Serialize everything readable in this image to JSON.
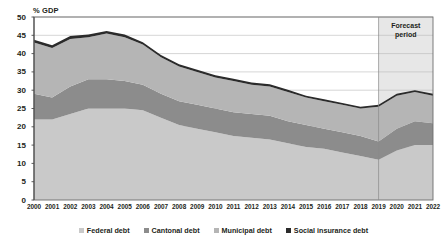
{
  "chart_data": {
    "type": "area",
    "stacked": true,
    "title": "",
    "xlabel": "",
    "ylabel": "% GDP",
    "ylim": [
      0,
      50
    ],
    "ytick_step": 5,
    "yticks": [
      0,
      5,
      10,
      15,
      20,
      25,
      30,
      35,
      40,
      45,
      50
    ],
    "grid": true,
    "grid_axis": "y",
    "legend_position": "bottom",
    "categories": [
      "2000",
      "2001",
      "2002",
      "2003",
      "2004",
      "2005",
      "2006",
      "2007",
      "2008",
      "2009",
      "2010",
      "2011",
      "2012",
      "2013",
      "2014",
      "2015",
      "2016",
      "2017",
      "2018",
      "2019",
      "2020",
      "2021",
      "2022"
    ],
    "series": [
      {
        "name": "Federal debt",
        "color": "#c9c9c9",
        "values": [
          22.0,
          22.0,
          23.5,
          25.0,
          25.0,
          25.0,
          24.5,
          22.5,
          20.5,
          19.5,
          18.5,
          17.5,
          17.0,
          16.5,
          15.5,
          14.5,
          14.0,
          13.0,
          12.0,
          11.0,
          13.5,
          15.0,
          15.0
        ]
      },
      {
        "name": "Cantonal debt",
        "color": "#8c8c8c",
        "values": [
          7.0,
          6.0,
          7.5,
          8.0,
          8.0,
          7.5,
          7.0,
          6.5,
          6.5,
          6.5,
          6.5,
          6.5,
          6.5,
          6.5,
          6.0,
          6.0,
          5.5,
          5.5,
          5.5,
          5.0,
          6.0,
          6.5,
          6.0
        ]
      },
      {
        "name": "Municipal debt",
        "color": "#b5b5b5",
        "values": [
          14.0,
          13.5,
          13.0,
          11.5,
          12.5,
          12.0,
          11.0,
          10.0,
          9.5,
          9.0,
          8.5,
          8.5,
          8.0,
          8.0,
          8.0,
          7.5,
          7.5,
          7.5,
          7.5,
          9.5,
          9.0,
          8.0,
          7.5
        ]
      },
      {
        "name": "Social insurance debt",
        "color": "#2b2b2b",
        "values": [
          0.8,
          0.8,
          0.8,
          0.7,
          0.7,
          0.7,
          0.6,
          0.6,
          0.6,
          0.6,
          0.6,
          0.6,
          0.6,
          0.6,
          0.6,
          0.5,
          0.5,
          0.5,
          0.5,
          0.5,
          0.5,
          0.5,
          0.5
        ]
      }
    ],
    "totals": [
      43.8,
      42.3,
      44.8,
      45.2,
      46.2,
      45.2,
      43.1,
      39.6,
      37.1,
      35.6,
      34.1,
      33.1,
      32.1,
      31.6,
      30.1,
      28.5,
      27.5,
      26.5,
      25.5,
      26.0,
      29.0,
      30.0,
      29.0
    ],
    "annotations": [
      {
        "name": "forecast-period",
        "label_line1": "Forecast",
        "label_line2": "period",
        "start_category": "2019",
        "end_category": "2022",
        "shade_color": "#d9d9d9"
      }
    ]
  }
}
